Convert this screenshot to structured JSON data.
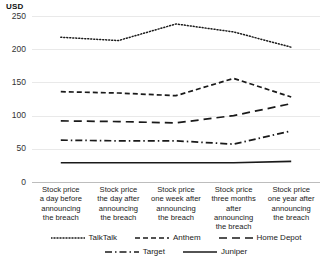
{
  "chart_data": {
    "type": "line",
    "title": "",
    "ylabel": "USD",
    "xlabel": "",
    "ylim": [
      0,
      250
    ],
    "yticks": [
      250,
      200,
      150,
      100,
      50,
      0
    ],
    "grid": true,
    "legend_position": "bottom",
    "categories": [
      "Stock price a day before announcing the breach",
      "Stock price the day after announcing the breach",
      "Stock price one week after announcing the breach",
      "Stock price three months after announcing the breach",
      "Stock price one year after announcing the breach"
    ],
    "category_lines": [
      [
        "Stock price",
        "a day before",
        "announcing",
        "the breach"
      ],
      [
        "Stock price",
        "the day after",
        "announcing",
        "the breach"
      ],
      [
        "Stock price",
        "one week after",
        "announcing",
        "the breach"
      ],
      [
        "Stock price",
        "three months",
        "after announcing",
        "the breach"
      ],
      [
        "Stock price",
        "one year after",
        "announcing",
        "the breach"
      ]
    ],
    "series": [
      {
        "name": "TalkTalk",
        "dash": "dotted",
        "values": [
          218,
          213,
          238,
          226,
          203
        ],
        "color": "#1a1a1a"
      },
      {
        "name": "Anthem",
        "dash": "dashed",
        "values": [
          136,
          134,
          130,
          156,
          128
        ],
        "color": "#1a1a1a"
      },
      {
        "name": "Home Depot",
        "dash": "longdash",
        "values": [
          92,
          91,
          89,
          100,
          118
        ],
        "color": "#1a1a1a"
      },
      {
        "name": "Target",
        "dash": "dashdot",
        "values": [
          63,
          62,
          62,
          57,
          77
        ],
        "color": "#1a1a1a"
      },
      {
        "name": "Juniper",
        "dash": "solid",
        "values": [
          29,
          29,
          29,
          29,
          31
        ],
        "color": "#1a1a1a"
      }
    ]
  },
  "axis": {
    "y_title": "USD",
    "ticks": [
      "250",
      "200",
      "150",
      "100",
      "50",
      "0"
    ]
  },
  "legend": {
    "row1": [
      "TalkTalk",
      "Anthem",
      "Home Depot"
    ],
    "row2": [
      "Target",
      "Juniper"
    ]
  }
}
